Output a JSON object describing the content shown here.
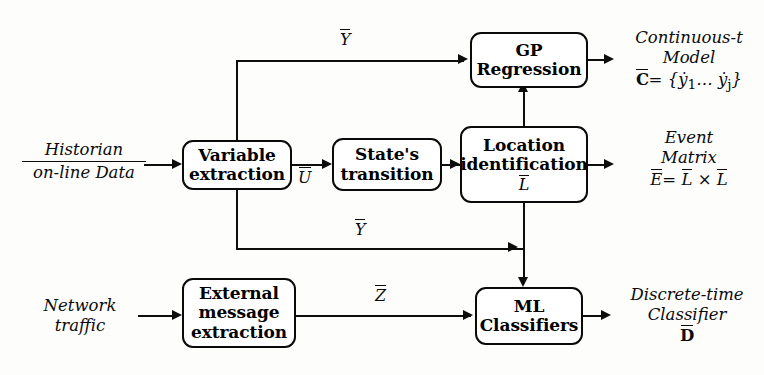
{
  "diagram": {
    "width": 764,
    "height": 375,
    "ink_color": "#0d0d0d",
    "background_color": "#fdfdfc"
  },
  "boxes": {
    "variable_extraction": {
      "line1": "Variable",
      "line2": "extraction"
    },
    "states_transition": {
      "line1": "State's",
      "line2": "transition"
    },
    "location_identification": {
      "line1": "Location",
      "line2": "identification",
      "line3": "L"
    },
    "gp_regression": {
      "line1": "GP",
      "line2": "Regression"
    },
    "external_message_extraction": {
      "line1": "External",
      "line2": "message",
      "line3": "extraction"
    },
    "ml_classifiers": {
      "line1": "ML",
      "line2": "Classifiers"
    }
  },
  "inputs": {
    "historian": {
      "numerator": "Historian",
      "denominator": "on-line Data"
    },
    "network": {
      "line1": "Network",
      "line2": "traffic"
    }
  },
  "outputs": {
    "continuous_model": {
      "line1": "Continuous-t",
      "line2": "Model",
      "formula_lhs": "C",
      "formula_rhs": "= {ẏ",
      "formula_sub1": "1",
      "formula_mid": "… ẏ",
      "formula_sub2": "j",
      "formula_end": "}"
    },
    "event_matrix": {
      "line1": "Event",
      "line2": "Matrix",
      "formula_lhs": "E",
      "formula_eq": "=",
      "formula_a": "L",
      "formula_times": "×",
      "formula_b": "L"
    },
    "discrete_classifier": {
      "line1": "Discrete-time",
      "line2": "Classifier",
      "symbol": "D"
    }
  },
  "signals": {
    "u": "U",
    "y_top": "Y",
    "y_bottom": "Y",
    "z": "Z",
    "l": "L"
  }
}
